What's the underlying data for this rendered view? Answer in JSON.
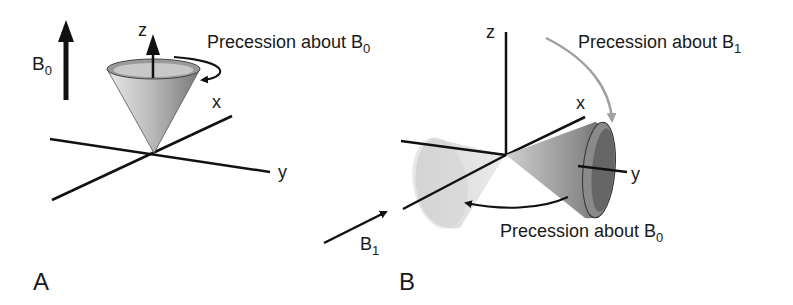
{
  "panel_a": {
    "label": "A",
    "field_label": "B",
    "field_sub": "0",
    "axis_z": "z",
    "axis_x": "x",
    "axis_y": "y",
    "precession_text": "Precession about B",
    "precession_sub": "0"
  },
  "panel_b": {
    "label": "B",
    "axis_z": "z",
    "axis_x": "x",
    "axis_y": "y",
    "precession_b1_text": "Precession about B",
    "precession_b1_sub": "1",
    "precession_b0_text": "Precession about B",
    "precession_b0_sub": "0",
    "field_label": "B",
    "field_sub": "1"
  },
  "colors": {
    "line": "#111111",
    "gray_arrow": "#a0a0a0",
    "cone_dark": "#5a5a5a",
    "cone_light": "#d0d0d0"
  }
}
